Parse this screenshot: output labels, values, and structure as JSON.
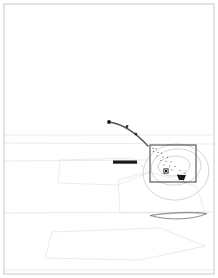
{
  "document": {
    "kind": "scanned-site-plan",
    "title": "",
    "page_background": "#ffffff",
    "border_color": "#b8b8b8",
    "faint_line_color": "#e2e2e2",
    "contour_color": "#c6c6c6",
    "ink_color": "#3a3a3a",
    "dark_fill": "#1a1a1a"
  },
  "frame": {
    "name": "page-border",
    "x": 4,
    "y": 4,
    "width": 210,
    "height": 270,
    "stroke_width": 0.8
  },
  "faint_survey_lines": [
    {
      "name": "upper-horizon-line",
      "x1": 5,
      "y1": 135,
      "x2": 213,
      "y2": 135
    },
    {
      "name": "mid-horizon-line",
      "x1": 5,
      "y1": 143,
      "x2": 213,
      "y2": 144
    },
    {
      "name": "lower-horizon-line",
      "x1": 5,
      "y1": 161,
      "x2": 150,
      "y2": 160
    },
    {
      "name": "field-edge-line",
      "x1": 5,
      "y1": 213,
      "x2": 213,
      "y2": 212
    },
    {
      "name": "field-base-line",
      "x1": 5,
      "y1": 270,
      "x2": 213,
      "y2": 270
    }
  ],
  "faint_polygons": [
    {
      "name": "parcel-outline-upper",
      "points": "60,160 132,158 150,172 118,185 58,183"
    },
    {
      "name": "parcel-outline-lower",
      "points": "52,232 160,228 205,246 140,260 45,258"
    },
    {
      "name": "parcel-outline-wedge",
      "points": "118,180 150,172 196,186 205,212 120,213"
    }
  ],
  "road_path": {
    "name": "curved-route-line",
    "path": "M 109 122 C 124 124 136 133 148 146",
    "stroke_width": 1.4,
    "end_dot": {
      "x": 109,
      "y": 122,
      "r": 1.9
    },
    "markers": [
      {
        "name": "route-marker-1",
        "x": 127,
        "y": 126.5,
        "size": 2.4,
        "rotation": 20
      },
      {
        "name": "route-marker-2",
        "x": 136,
        "y": 134,
        "size": 2.2,
        "rotation": 35
      }
    ]
  },
  "detail_box": {
    "name": "detail-inset-rectangle",
    "x": 150,
    "y": 145,
    "width": 46,
    "height": 37,
    "stroke_width": 1.0
  },
  "contours": [
    {
      "name": "contour-outer",
      "cx": 176,
      "cy": 172,
      "rx": 33,
      "ry": 28,
      "rotation": -8
    },
    {
      "name": "contour-middle",
      "cx": 176,
      "cy": 167,
      "rx": 25,
      "ry": 18,
      "rotation": -8
    },
    {
      "name": "contour-inner",
      "cx": 174,
      "cy": 166,
      "rx": 16,
      "ry": 10,
      "rotation": -6
    }
  ],
  "point_symbols": [
    {
      "name": "survey-point",
      "x": 153,
      "y": 148.5,
      "size": 1.1
    },
    {
      "name": "survey-point",
      "x": 156,
      "y": 148.8,
      "size": 1.0
    },
    {
      "name": "survey-point",
      "x": 153.5,
      "y": 151.5,
      "size": 1.0
    },
    {
      "name": "survey-point",
      "x": 158,
      "y": 152.5,
      "size": 1.0
    },
    {
      "name": "survey-point",
      "x": 161.5,
      "y": 153.2,
      "size": 1.0
    },
    {
      "name": "survey-point",
      "x": 157,
      "y": 156,
      "size": 1.0
    },
    {
      "name": "survey-point",
      "x": 163,
      "y": 157,
      "size": 1.0
    },
    {
      "name": "survey-point",
      "x": 167.5,
      "y": 157.5,
      "size": 1.0
    },
    {
      "name": "survey-point",
      "x": 161,
      "y": 160.5,
      "size": 1.0
    },
    {
      "name": "survey-point",
      "x": 166,
      "y": 161.5,
      "size": 1.0
    },
    {
      "name": "survey-point",
      "x": 171,
      "y": 162,
      "size": 1.0
    },
    {
      "name": "survey-point",
      "x": 164,
      "y": 165,
      "size": 1.0
    },
    {
      "name": "survey-point",
      "x": 169.5,
      "y": 166,
      "size": 1.0
    },
    {
      "name": "survey-point",
      "x": 175,
      "y": 166.5,
      "size": 1.0
    },
    {
      "name": "survey-point",
      "x": 172,
      "y": 170,
      "size": 1.0
    },
    {
      "name": "survey-point",
      "x": 180,
      "y": 170.5,
      "size": 1.0
    },
    {
      "name": "survey-point",
      "x": 178,
      "y": 174.5,
      "size": 1.0
    },
    {
      "name": "survey-point",
      "x": 185,
      "y": 173.5,
      "size": 1.0
    }
  ],
  "station_marker": {
    "name": "station-square-symbol",
    "x": 166,
    "y": 171,
    "outer": 4.2,
    "inner": 2.0
  },
  "pad_marker": {
    "name": "dark-pad-symbol",
    "points": "177,175 186,175 184,180 179,180",
    "leader": {
      "x1": 183,
      "y1": 180,
      "x2": 185,
      "y2": 183
    }
  },
  "scale_bar": {
    "name": "scale-bar",
    "x": 113,
    "y": 160.5,
    "width": 24,
    "height": 3.2
  },
  "lens_feature": {
    "name": "elongated-lens-outline",
    "path": "M 150 215.5 C 168 212.5 192 211.5 207 213.5 C 194 219.5 170 221 150 215.5 Z",
    "inner_path": "M 152 215.2 C 170 213 191 212.3 205 213.9",
    "stroke_width": 0.8
  }
}
